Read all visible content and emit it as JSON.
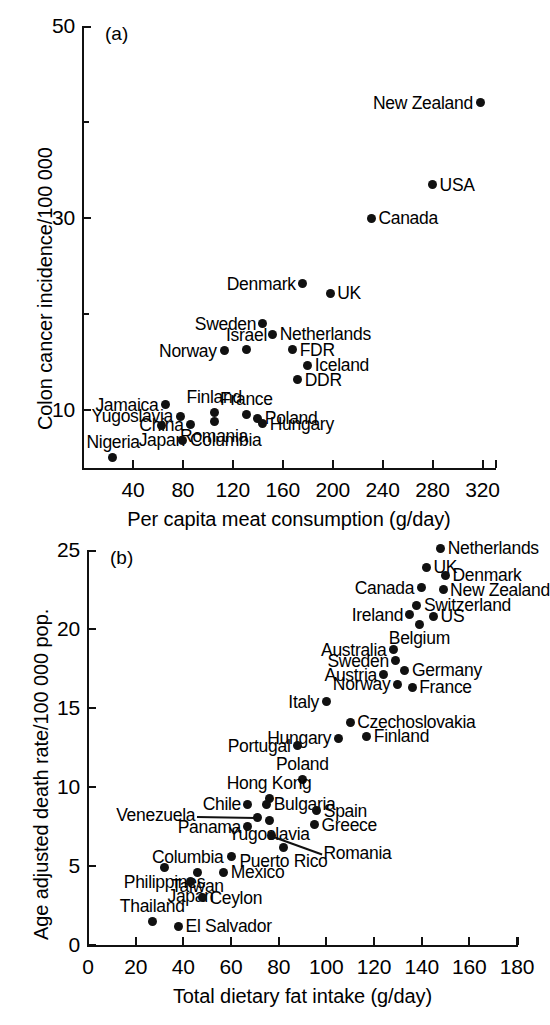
{
  "figure": {
    "background": "#ffffff",
    "ink": "#111111"
  },
  "chart_data": [
    {
      "type": "scatter",
      "panel_tag": "(a)",
      "title": "",
      "xlabel": "Per capita meat consumption (g/day)",
      "ylabel": "Colon cancer incidence/100 000",
      "xlim": [
        0,
        330
      ],
      "ylim": [
        4,
        50
      ],
      "xticks": [
        40,
        80,
        120,
        160,
        200,
        240,
        280,
        320
      ],
      "yticks": [
        10,
        30,
        50
      ],
      "yminorticks": [
        20,
        40
      ],
      "grid": false,
      "legend": "none",
      "points": [
        {
          "label": "New Zealand",
          "x": 318,
          "y": 42.0,
          "label_pos": "left"
        },
        {
          "label": "USA",
          "x": 280,
          "y": 33.5,
          "label_pos": "right"
        },
        {
          "label": "Canada",
          "x": 231,
          "y": 30.0,
          "label_pos": "right"
        },
        {
          "label": "Denmark",
          "x": 176,
          "y": 23.2,
          "label_pos": "left"
        },
        {
          "label": "UK",
          "x": 198,
          "y": 22.2,
          "label_pos": "right"
        },
        {
          "label": "Sweden",
          "x": 144,
          "y": 19.0,
          "label_pos": "left"
        },
        {
          "label": "Netherlands",
          "x": 152,
          "y": 17.9,
          "label_pos": "right"
        },
        {
          "label": "Israel",
          "x": 131,
          "y": 16.3,
          "label_pos": "above"
        },
        {
          "label": "Norway",
          "x": 113,
          "y": 16.2,
          "label_pos": "left"
        },
        {
          "label": "FDR",
          "x": 168,
          "y": 16.3,
          "label_pos": "right"
        },
        {
          "label": "Iceland",
          "x": 180,
          "y": 14.7,
          "label_pos": "right"
        },
        {
          "label": "DDR",
          "x": 172,
          "y": 13.2,
          "label_pos": "right"
        },
        {
          "label": "Jamaica",
          "x": 66,
          "y": 10.6,
          "label_pos": "left"
        },
        {
          "label": "Finland",
          "x": 105,
          "y": 9.8,
          "label_pos": "above"
        },
        {
          "label": "France",
          "x": 131,
          "y": 9.6,
          "label_pos": "above"
        },
        {
          "label": "Yugoslavia",
          "x": 78,
          "y": 9.4,
          "label_pos": "left"
        },
        {
          "label": "Poland",
          "x": 140,
          "y": 9.2,
          "label_pos": "right"
        },
        {
          "label": "Hungary",
          "x": 144,
          "y": 8.6,
          "label_pos": "right"
        },
        {
          "label": "China",
          "x": 86,
          "y": 8.5,
          "label_pos": "left"
        },
        {
          "label": "Romania",
          "x": 105,
          "y": 8.8,
          "label_pos": "below"
        },
        {
          "label": "Japan",
          "x": 63,
          "y": 8.4,
          "label_pos": "below"
        },
        {
          "label": "Columbia",
          "x": 80,
          "y": 6.9,
          "label_pos": "right"
        },
        {
          "label": "Nigeria",
          "x": 24,
          "y": 5.1,
          "label_pos": "above"
        }
      ]
    },
    {
      "type": "scatter",
      "panel_tag": "(b)",
      "title": "",
      "xlabel": "Total dietary fat intake (g/day)",
      "ylabel": "Age adjusted death rate/100 000 pop.",
      "xlim": [
        0,
        180
      ],
      "ylim": [
        0,
        25
      ],
      "xticks": [
        0,
        20,
        40,
        60,
        80,
        100,
        120,
        140,
        160,
        180
      ],
      "yticks": [
        0,
        5,
        10,
        15,
        20,
        25
      ],
      "grid": false,
      "legend": "none",
      "points": [
        {
          "label": "Netherlands",
          "x": 148,
          "y": 25.1,
          "label_pos": "right"
        },
        {
          "label": "UK",
          "x": 142,
          "y": 23.9,
          "label_pos": "right"
        },
        {
          "label": "Denmark",
          "x": 150,
          "y": 23.4,
          "label_pos": "right"
        },
        {
          "label": "Canada",
          "x": 140,
          "y": 22.6,
          "label_pos": "left"
        },
        {
          "label": "New Zealand",
          "x": 149,
          "y": 22.5,
          "label_pos": "right"
        },
        {
          "label": "Switzerland",
          "x": 138,
          "y": 21.5,
          "label_pos": "right"
        },
        {
          "label": "Ireland",
          "x": 135,
          "y": 20.9,
          "label_pos": "left"
        },
        {
          "label": "US",
          "x": 145,
          "y": 20.8,
          "label_pos": "right"
        },
        {
          "label": "Belgium",
          "x": 139,
          "y": 20.3,
          "label_pos": "below"
        },
        {
          "label": "Australia",
          "x": 128,
          "y": 18.7,
          "label_pos": "left"
        },
        {
          "label": "Sweden",
          "x": 129,
          "y": 18.0,
          "label_pos": "left"
        },
        {
          "label": "Germany",
          "x": 133,
          "y": 17.4,
          "label_pos": "right"
        },
        {
          "label": "Austria",
          "x": 124,
          "y": 17.1,
          "label_pos": "left"
        },
        {
          "label": "Norway",
          "x": 130,
          "y": 16.5,
          "label_pos": "left"
        },
        {
          "label": "France",
          "x": 136,
          "y": 16.3,
          "label_pos": "right"
        },
        {
          "label": "Italy",
          "x": 100,
          "y": 15.4,
          "label_pos": "left"
        },
        {
          "label": "Czechoslovakia",
          "x": 110,
          "y": 14.1,
          "label_pos": "right"
        },
        {
          "label": "Hungary",
          "x": 105,
          "y": 13.1,
          "label_pos": "left"
        },
        {
          "label": "Finland",
          "x": 117,
          "y": 13.2,
          "label_pos": "right"
        },
        {
          "label": "Portugal",
          "x": 88,
          "y": 12.6,
          "label_pos": "left"
        },
        {
          "label": "Poland",
          "x": 90,
          "y": 10.5,
          "label_pos": "above"
        },
        {
          "label": "Hong Kong",
          "x": 76,
          "y": 9.3,
          "label_pos": "above"
        },
        {
          "label": "Chile",
          "x": 67,
          "y": 8.9,
          "label_pos": "left"
        },
        {
          "label": "Bulgaria",
          "x": 75,
          "y": 8.9,
          "label_pos": "right"
        },
        {
          "label": "Spain",
          "x": 96,
          "y": 8.5,
          "label_pos": "right"
        },
        {
          "label": "Venezuela",
          "x": 71,
          "y": 8.1,
          "label_pos": "leader-left"
        },
        {
          "label": "Panama",
          "x": 67,
          "y": 7.5,
          "label_pos": "left"
        },
        {
          "label": "Greece",
          "x": 95,
          "y": 7.6,
          "label_pos": "right"
        },
        {
          "label": "Yugoslavia",
          "x": 76,
          "y": 7.9,
          "label_pos": "below"
        },
        {
          "label": "Romania",
          "x": 77,
          "y": 6.9,
          "label_pos": "leader-right"
        },
        {
          "label": "Puerto Rico",
          "x": 82,
          "y": 6.2,
          "label_pos": "below"
        },
        {
          "label": "Columbia",
          "x": 60,
          "y": 5.6,
          "label_pos": "left"
        },
        {
          "label": "Philippines",
          "x": 32,
          "y": 4.9,
          "label_pos": "below"
        },
        {
          "label": "Mexico",
          "x": 57,
          "y": 4.6,
          "label_pos": "right"
        },
        {
          "label": "Taiwan",
          "x": 46,
          "y": 4.6,
          "label_pos": "below"
        },
        {
          "label": "Japan",
          "x": 43,
          "y": 4.0,
          "label_pos": "below"
        },
        {
          "label": "Ceylon",
          "x": 48,
          "y": 3.0,
          "label_pos": "right"
        },
        {
          "label": "Thailand",
          "x": 27,
          "y": 1.5,
          "label_pos": "above"
        },
        {
          "label": "El Salvador",
          "x": 38,
          "y": 1.2,
          "label_pos": "right"
        }
      ]
    }
  ]
}
